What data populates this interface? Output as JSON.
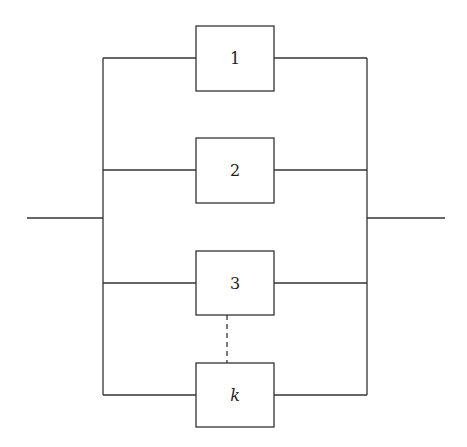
{
  "diagram": {
    "type": "parallel-system-block-diagram",
    "components": [
      {
        "label": "1",
        "italic": false
      },
      {
        "label": "2",
        "italic": false
      },
      {
        "label": "3",
        "italic": false
      },
      {
        "label": "k",
        "italic": true
      }
    ],
    "ellipsis_connector": "dashed line between component 3 and component k"
  },
  "colors": {
    "line": "#333333",
    "background": "#ffffff"
  }
}
